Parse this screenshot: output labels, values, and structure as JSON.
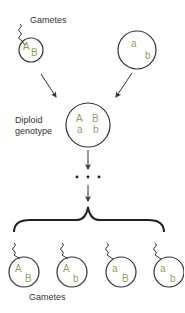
{
  "diagram": {
    "labels": {
      "top_gametes": "Gametes",
      "diploid_line1": "Diploid",
      "diploid_line2": "genotype",
      "bottom_gametes": "Gametes"
    },
    "parent_gametes": [
      {
        "allele1": "A",
        "allele2": "B"
      },
      {
        "allele1": "a",
        "allele2": "b"
      }
    ],
    "diploid": {
      "row1": [
        "A",
        "B"
      ],
      "row2": [
        "a",
        "b"
      ]
    },
    "continuation": "• • •",
    "offspring_gametes": [
      {
        "allele1": "A",
        "allele2": "B"
      },
      {
        "allele1": "A",
        "allele2": "b"
      },
      {
        "allele1": "a",
        "allele2": "B"
      },
      {
        "allele1": "a",
        "allele2": "b"
      }
    ],
    "colors": {
      "allele": "#8aa65a",
      "outline": "#333333",
      "text": "#333333"
    }
  }
}
